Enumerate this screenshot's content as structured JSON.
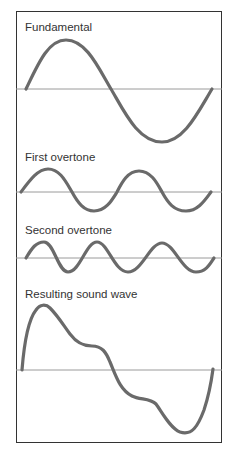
{
  "diagram": {
    "colors": {
      "wave": "#6a6a6a",
      "axis": "#9a9a9a",
      "frame": "#333333",
      "text": "#333333"
    },
    "panels": [
      {
        "label": "Fundamental",
        "label_top": 22,
        "axis_y": 89,
        "axis_x": [
          16,
          222
        ],
        "path": "M26,89 C38,64 48,40 66,40 C86,40 98,67 111,89 C124,111 138,142 162,142 C184,142 198,112 212,89"
      },
      {
        "label": "First overtone",
        "label_top": 152,
        "axis_y": 192,
        "axis_x": [
          16,
          222
        ],
        "path": "M21,192 C30,180 38,169 48,169 C60,169 66,182 72,192 C78,203 84,211 94,211 C106,211 112,200 117,192 C122,182 128,171 139,171 C151,171 157,183 162,192 C168,203 174,211 186,211 C198,211 205,200 211,192"
      },
      {
        "label": "Second overtone",
        "label_top": 225,
        "axis_y": 258,
        "axis_x": [
          16,
          222
        ],
        "path": "M26,258 C32,248 36,242 44,242 C54,242 58,272 68,272 C80,272 86,242 97,242 C108,242 114,272 128,272 C142,272 150,243 162,243 C174,243 182,272 196,272 C206,272 210,264 214,258"
      },
      {
        "label": "Resulting sound wave",
        "label_top": 289,
        "axis_y": 370,
        "axis_x": [
          16,
          222
        ],
        "path": "M22,370 C24,345 28,320 36,310 C40,304 46,304 50,308 C58,316 64,326 70,334 C76,342 82,346 92,346 C102,346 106,352 110,362 C116,376 120,390 132,396 C140,400 150,398 156,404 C162,412 170,428 180,432 C192,436 198,426 204,410 C208,398 211,384 213,369"
      }
    ]
  }
}
